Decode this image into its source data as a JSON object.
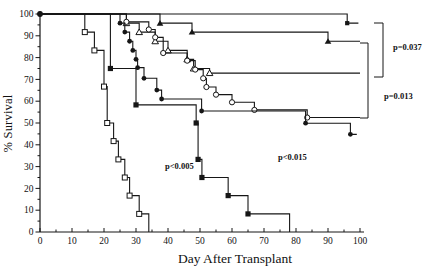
{
  "chart_data": {
    "type": "line",
    "subtype": "kaplan-meier-step-survival",
    "title": "",
    "xlabel": "Day After Transplant",
    "ylabel": "% Survival",
    "xlim": [
      0,
      100
    ],
    "ylim": [
      0,
      100
    ],
    "x_major_ticks": [
      0,
      10,
      20,
      30,
      40,
      50,
      60,
      70,
      80,
      90,
      100
    ],
    "y_major_ticks": [
      0,
      10,
      20,
      30,
      40,
      50,
      60,
      70,
      80,
      90,
      100
    ],
    "minor_tick_step": 5,
    "grid": false,
    "legend": "none",
    "curve_color": "#161616",
    "open_marker_fill": "#ffffff",
    "origin_marker": {
      "day": 0,
      "pct": 100
    },
    "series": [
      {
        "name": "filled-square-small-top",
        "marker": "filled-square-small",
        "steps": [
          [
            96,
            95.8
          ]
        ],
        "end_day": 99.5
      },
      {
        "name": "filled-triangle",
        "marker": "filled-triangle",
        "steps": [
          [
            37.5,
            95.8
          ],
          [
            47.5,
            91.7
          ],
          [
            90,
            87.5
          ]
        ],
        "end_day": 100
      },
      {
        "name": "open-triangle",
        "marker": "open-triangle",
        "steps": [
          [
            27,
            95.8
          ],
          [
            31,
            91.7
          ],
          [
            36,
            87.5
          ],
          [
            40,
            83.3
          ],
          [
            46,
            79.2
          ],
          [
            48,
            75
          ],
          [
            53,
            72.9
          ]
        ],
        "end_day": 100
      },
      {
        "name": "open-circle",
        "marker": "open-circle",
        "steps": [
          [
            27,
            96.4
          ],
          [
            34,
            92.9
          ],
          [
            36,
            89.3
          ],
          [
            38.5,
            82.1
          ],
          [
            46,
            78.6
          ],
          [
            48.5,
            74.5
          ],
          [
            51,
            70.5
          ],
          [
            52,
            66.5
          ],
          [
            55,
            63
          ],
          [
            60,
            59.5
          ],
          [
            67,
            56
          ],
          [
            83.5,
            52.5
          ]
        ],
        "end_day": 100
      },
      {
        "name": "filled-circle",
        "marker": "filled-circle",
        "steps": [
          [
            25,
            95.8
          ],
          [
            26.5,
            91.7
          ],
          [
            28,
            87.5
          ],
          [
            29,
            83.3
          ],
          [
            30,
            79.2
          ],
          [
            30.5,
            75.4
          ],
          [
            32.5,
            70.5
          ],
          [
            36.5,
            65.1
          ],
          [
            38,
            61
          ],
          [
            50.5,
            55.5
          ],
          [
            83,
            49.9
          ],
          [
            97,
            44.8
          ]
        ],
        "end_day": 99
      },
      {
        "name": "filled-square",
        "marker": "filled-square",
        "steps": [
          [
            22,
            75
          ],
          [
            30,
            58.3
          ],
          [
            48.8,
            50
          ],
          [
            49.4,
            33.3
          ],
          [
            50.6,
            25
          ],
          [
            58.8,
            16.7
          ],
          [
            65,
            8.3
          ],
          [
            78,
            0
          ]
        ],
        "end_day": 78
      },
      {
        "name": "open-square",
        "marker": "open-square",
        "steps": [
          [
            14,
            91.7
          ],
          [
            17,
            83.3
          ],
          [
            20,
            66.7
          ],
          [
            21,
            50
          ],
          [
            23,
            41.7
          ],
          [
            24.5,
            33.3
          ],
          [
            26.5,
            25
          ],
          [
            28,
            16.7
          ],
          [
            31,
            8.3
          ],
          [
            34,
            0
          ]
        ],
        "end_day": 34
      }
    ],
    "annotations": [
      {
        "label": "p<0.005",
        "px": 165,
        "py": 169
      },
      {
        "label": "p<0.015",
        "px": 278,
        "py": 160
      },
      {
        "label": "p=0.037",
        "px": 393,
        "py": 50
      },
      {
        "label": "p=0.013",
        "px": 384,
        "py": 99
      }
    ],
    "brackets": [
      {
        "name": "bracket-p-0.037",
        "x": 383,
        "y_top": 23,
        "y_bottom": 77,
        "stub": 9
      },
      {
        "name": "bracket-p-0.013",
        "x": 368,
        "y_top": 43,
        "y_bottom": 118,
        "stub": 8
      }
    ]
  }
}
